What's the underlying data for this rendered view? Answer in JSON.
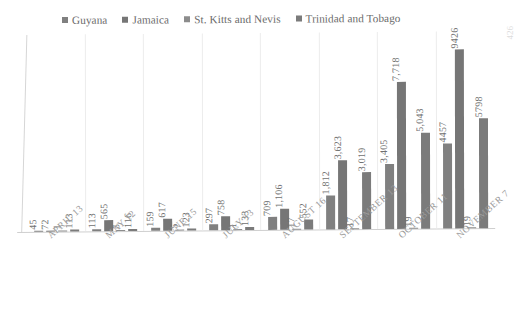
{
  "page_number": "426",
  "legend": {
    "position": "top",
    "items": [
      {
        "label": "Guyana",
        "color": "#808080",
        "icon": "square-marker-icon"
      },
      {
        "label": "Jamaica",
        "color": "#767676",
        "icon": "square-marker-icon"
      },
      {
        "label": "St.  Kitts and Nevis",
        "color": "#8c8c8c",
        "icon": "square-marker-icon"
      },
      {
        "label": "Trinidad and Tobago",
        "color": "#7b7b7b",
        "icon": "square-marker-icon"
      }
    ]
  },
  "chart_data": {
    "type": "bar",
    "title": "",
    "subtitle": "",
    "xlabel": "",
    "ylabel": "",
    "grid": false,
    "legend_position": "top",
    "ylim": [
      0,
      10000
    ],
    "categories": [
      "APRIL 13",
      "MAY 12",
      "JUNE 15",
      "JULY 13",
      "AUGUST 16",
      "SEPTEMBER 13",
      "OCTOBER 11",
      "NOVEMBER 7"
    ],
    "series": [
      {
        "name": "Guyana",
        "values": [
          45,
          113,
          159,
          297,
          709,
          1812,
          3405,
          4457
        ],
        "labels": [
          "45",
          "113",
          "159",
          "297",
          "709",
          "1,812",
          "3,405",
          "4457"
        ]
      },
      {
        "name": "Jamaica",
        "values": [
          72,
          565,
          617,
          758,
          1106,
          3623,
          7718,
          9426
        ],
        "labels": [
          "72",
          "565",
          "617",
          "758",
          "1,106",
          "3,623",
          "7,718",
          "9426"
        ]
      },
      {
        "name": "St.  Kitts and Nevis",
        "values": [
          1,
          5,
          5,
          1,
          17,
          17,
          19,
          19
        ],
        "labels": [
          "1",
          "5",
          "5",
          "1",
          "17",
          "17",
          "19",
          "19"
        ]
      },
      {
        "name": "Trinidad and Tobago",
        "values": [
          113,
          116,
          123,
          133,
          552,
          3019,
          5043,
          5798
        ],
        "labels": [
          "113",
          "116",
          "123",
          "133",
          "552",
          "3,019",
          "5,043",
          "5798"
        ]
      }
    ]
  }
}
